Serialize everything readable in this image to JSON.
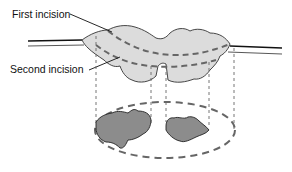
{
  "diagram": {
    "labels": {
      "first_incision": "First incision",
      "second_incision": "Second incision"
    },
    "elements": [
      {
        "name": "tissue-cross-section",
        "description": "light gray irregular tissue mass spanning skin surface"
      },
      {
        "name": "first-incision-line",
        "style": "dashed"
      },
      {
        "name": "second-incision-line",
        "style": "dashed"
      },
      {
        "name": "projection-lines",
        "style": "dashed vertical",
        "count": 5
      },
      {
        "name": "projection-ellipse",
        "style": "dashed"
      },
      {
        "name": "projected-defect-left",
        "fill": "dark gray"
      },
      {
        "name": "projected-defect-right",
        "fill": "dark gray"
      }
    ],
    "colors": {
      "tissue_fill": "#dcdcdc",
      "defect_fill": "#8c8c8c",
      "dash_stroke": "#666666",
      "outline": "#333333"
    }
  }
}
